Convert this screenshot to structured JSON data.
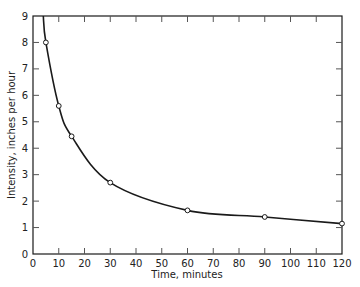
{
  "chart_data": {
    "type": "line",
    "title": "",
    "xlabel": "Time, minutes",
    "ylabel": "Intensity, inches per hour",
    "xlim": [
      0,
      120
    ],
    "ylim": [
      0,
      9
    ],
    "x_ticks": [
      0,
      10,
      20,
      30,
      40,
      50,
      60,
      70,
      80,
      90,
      100,
      110,
      120
    ],
    "y_ticks": [
      0,
      1,
      2,
      3,
      4,
      5,
      6,
      7,
      8,
      9
    ],
    "grid": false,
    "legend": null,
    "series": [
      {
        "name": "Intensity",
        "x": [
          5,
          10,
          15,
          30,
          60,
          90,
          120
        ],
        "values": [
          8.0,
          5.6,
          4.45,
          2.7,
          1.65,
          1.4,
          1.15
        ],
        "marker": "open-circle",
        "color": "#1a1a1a"
      }
    ],
    "curve_extends_above_top_near_x": 4
  },
  "axes": {
    "x_label": "Time, minutes",
    "y_label": "Intensity, inches per hour"
  }
}
